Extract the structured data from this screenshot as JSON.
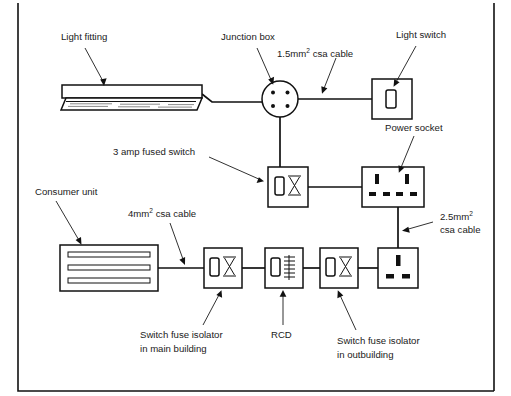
{
  "diagram": {
    "border_color": "#111111",
    "line_color": "#111111",
    "text_color": "#1a1a1a",
    "background": "#ffffff",
    "labels": {
      "light_fitting": "Light fitting",
      "junction_box": "Junction box",
      "cable_1_5": "1.5mm",
      "cable_1_5_sup": "2",
      "cable_1_5_rest": " csa cable",
      "light_switch": "Light switch",
      "power_socket": "Power socket",
      "fused_switch": "3 amp fused switch",
      "consumer_unit": "Consumer unit",
      "cable_4": "4mm",
      "cable_4_sup": "2",
      "cable_4_rest": " csa cable",
      "cable_2_5": "2.5mm",
      "cable_2_5_sup": "2",
      "cable_2_5_line2": "csa cable",
      "switch_fuse_main_1": "Switch fuse isolator",
      "switch_fuse_main_2": "in main building",
      "rcd": "RCD",
      "switch_fuse_out_1": "Switch fuse isolator",
      "switch_fuse_out_2": "in outbuilding"
    },
    "components": [
      {
        "name": "light-fitting",
        "type": "fluorescent-fitting",
        "x": 62,
        "y": 85,
        "w": 140,
        "h": 20
      },
      {
        "name": "junction-box",
        "type": "circle-4-terminal",
        "cx": 280,
        "cy": 99,
        "r": 18
      },
      {
        "name": "light-switch",
        "type": "single-rocker-switch",
        "x": 372,
        "y": 79,
        "w": 40,
        "h": 40
      },
      {
        "name": "fused-switch-3amp",
        "type": "switched-fuse",
        "x": 268,
        "y": 167,
        "w": 40,
        "h": 40
      },
      {
        "name": "power-socket-double",
        "type": "double-socket",
        "x": 362,
        "y": 167,
        "w": 62,
        "h": 40
      },
      {
        "name": "consumer-unit",
        "type": "consumer-unit",
        "x": 60,
        "y": 245,
        "w": 98,
        "h": 46
      },
      {
        "name": "switch-fuse-isolator-main",
        "type": "switched-fuse",
        "x": 204,
        "y": 248,
        "w": 38,
        "h": 40
      },
      {
        "name": "rcd",
        "type": "rcd",
        "x": 265,
        "y": 248,
        "w": 38,
        "h": 40
      },
      {
        "name": "switch-fuse-isolator-outbuilding",
        "type": "switched-fuse",
        "x": 320,
        "y": 248,
        "w": 38,
        "h": 40
      },
      {
        "name": "power-socket-single",
        "type": "single-socket",
        "x": 378,
        "y": 248,
        "w": 40,
        "h": 40
      }
    ]
  }
}
